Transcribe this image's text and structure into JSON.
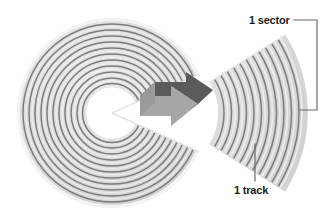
{
  "figure": {
    "background_color": "#ffffff"
  },
  "callouts": {
    "sector": {
      "label": "1 sector",
      "leader": "bracket-right",
      "icon_name": "bracket-leader-line"
    },
    "track": {
      "label": "1 track",
      "leader": "vertical-line",
      "icon_name": "straight-leader-line"
    }
  },
  "platter": {
    "name": "disk-platter",
    "center_x": 112,
    "center_y": 113,
    "outer_radius": 95,
    "hub_radius": 26,
    "track_count": 12,
    "cut_start_deg": -24,
    "cut_end_deg": 24,
    "band_color": "#d9d9d9",
    "line_color": "#7d7d7d",
    "edge_color": "#efefef",
    "hub_color": "#ffffff"
  },
  "sector_wedge": {
    "name": "exploded-sector-wedge",
    "center_x": 160,
    "center_y": 113,
    "inner_radius": 58,
    "outer_radius": 148,
    "start_deg": -32,
    "end_deg": 32,
    "band_count": 12,
    "band_color": "#d9d9d9",
    "line_color": "#7d7d7d"
  },
  "arrow": {
    "name": "pointer-arrow",
    "front_color": "#a6a6a6",
    "top_color": "#5a5a5a",
    "side_color": "#8c8c8c",
    "direction": "right"
  },
  "colors": {
    "ink": "#1b1b1b",
    "leader": "#6b6b6b",
    "band": "#d9d9d9",
    "groove": "#7d7d7d",
    "highlight": "#f2f2f2",
    "shadow": "#c2c2c2",
    "arrow_dark": "#5a5a5a",
    "arrow_light": "#a6a6a6"
  }
}
